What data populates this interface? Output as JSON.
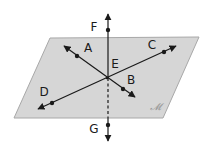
{
  "diagram": {
    "type": "geometry-plane-lines",
    "colors": {
      "background": "#ffffff",
      "plane_fill": "#d6d6d6",
      "plane_edge": "#a8a8a8",
      "line": "#1a1a1a",
      "label": "#1a1a1a",
      "plane_label": "#9a9a9a"
    },
    "plane": {
      "label": "𝓜",
      "corners": [
        [
          50,
          38
        ],
        [
          199,
          37
        ],
        [
          163,
          118
        ],
        [
          14,
          118
        ]
      ],
      "label_pos": [
        155,
        110
      ]
    },
    "intersection": {
      "name": "E",
      "point": [
        107,
        78
      ],
      "label_pos": [
        115,
        68
      ]
    },
    "points": {
      "A": {
        "label": "A",
        "dot": [
          77,
          56
        ],
        "label_pos": [
          88,
          52
        ]
      },
      "B": {
        "label": "B",
        "dot": [
          123,
          89
        ],
        "label_pos": [
          131,
          84
        ]
      },
      "C": {
        "label": "C",
        "dot": [
          164,
          52
        ],
        "label_pos": [
          152,
          49
        ]
      },
      "D": {
        "label": "D",
        "dot": [
          52,
          103
        ],
        "label_pos": [
          44,
          96
        ]
      },
      "F": {
        "label": "F",
        "dot": [
          108,
          30
        ],
        "label_pos": [
          94,
          31
        ]
      },
      "G": {
        "label": "G",
        "dot": [
          108,
          125
        ],
        "label_pos": [
          94,
          133
        ]
      }
    },
    "lines": [
      {
        "name": "line-AB",
        "from": [
          64,
          46
        ],
        "to": [
          135,
          97
        ],
        "style": "solid"
      },
      {
        "name": "line-DC",
        "from": [
          38,
          109
        ],
        "to": [
          176,
          46
        ],
        "style": "solid"
      },
      {
        "name": "line-FG-above",
        "from": [
          108,
          14
        ],
        "to": [
          108,
          78
        ],
        "style": "solid"
      },
      {
        "name": "line-FG-hidden",
        "from": [
          108,
          78
        ],
        "to": [
          108,
          118
        ],
        "style": "dashed"
      },
      {
        "name": "line-FG-below",
        "from": [
          108,
          118
        ],
        "to": [
          108,
          141
        ],
        "style": "solid"
      }
    ]
  }
}
